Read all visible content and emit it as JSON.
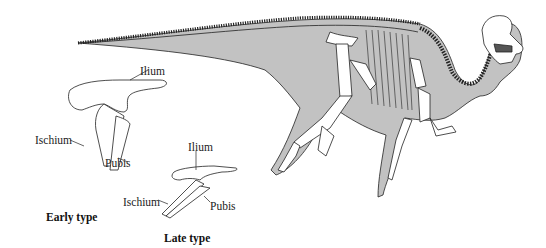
{
  "figure": {
    "colors": {
      "body_fill": "#c2c2c2",
      "bone_fill": "#ffffff",
      "line": "#222222"
    }
  },
  "early_type": {
    "caption": "Early type",
    "labels": {
      "ilium": "Ilium",
      "ischium": "Ischium",
      "pubis": "Pubis"
    }
  },
  "late_type": {
    "caption": "Late type",
    "labels": {
      "ilium": "Ilium",
      "ischium": "Ischium",
      "pubis": "Pubis"
    }
  }
}
